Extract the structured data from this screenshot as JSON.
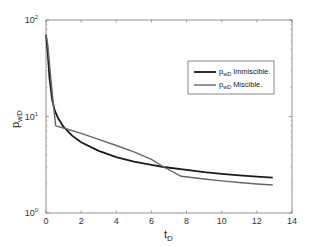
{
  "chart_data": {
    "type": "line",
    "title": "",
    "xlabel": "t_D",
    "ylabel": "p_wD",
    "xlim": [
      0,
      14
    ],
    "ylim": [
      1,
      100
    ],
    "yscale": "log",
    "grid": false,
    "legend_position": "upper right",
    "x_ticks": [
      "0",
      "2",
      "4",
      "6",
      "8",
      "10",
      "12",
      "14"
    ],
    "y_ticks": [
      "10^0",
      "10^1",
      "10^2"
    ],
    "series": [
      {
        "name": "p_wD Immiscible.",
        "color": "#1a1a1a",
        "x": [
          0.0,
          0.1,
          0.2,
          0.35,
          0.5,
          0.7,
          1.0,
          1.5,
          2.0,
          3.0,
          4.0,
          5.0,
          6.0,
          6.7,
          8.0,
          9.0,
          10.0,
          11.0,
          12.0,
          12.9
        ],
        "y": [
          70,
          45,
          25,
          15,
          11.5,
          9.5,
          7.8,
          6.3,
          5.4,
          4.4,
          3.8,
          3.4,
          3.15,
          3.0,
          2.8,
          2.65,
          2.55,
          2.45,
          2.38,
          2.32
        ]
      },
      {
        "name": "p_wD Miscible.",
        "color": "#666666",
        "x": [
          0.0,
          0.1,
          0.2,
          0.35,
          0.55,
          1.0,
          2.0,
          3.0,
          4.0,
          5.0,
          6.0,
          6.7,
          7.7,
          9.0,
          10.0,
          11.0,
          12.0,
          12.9
        ],
        "y": [
          70,
          55,
          35,
          18,
          8.0,
          7.6,
          6.7,
          5.8,
          5.0,
          4.3,
          3.6,
          3.0,
          2.4,
          2.25,
          2.15,
          2.07,
          2.0,
          1.95
        ]
      }
    ]
  },
  "axes": {
    "x_label_main": "t",
    "x_label_sub": "D",
    "y_label_main": "p",
    "y_label_sub": "wD",
    "y_tick_base": "10",
    "y_tick_exps": [
      "0",
      "1",
      "2"
    ],
    "x_tick_labels": [
      "0",
      "2",
      "4",
      "6",
      "8",
      "10",
      "12",
      "14"
    ]
  },
  "legend": {
    "items": [
      {
        "main": "p",
        "sub": "wD",
        "text": "Immiscible."
      },
      {
        "main": "p",
        "sub": "wD",
        "text": "Miscible."
      }
    ]
  }
}
